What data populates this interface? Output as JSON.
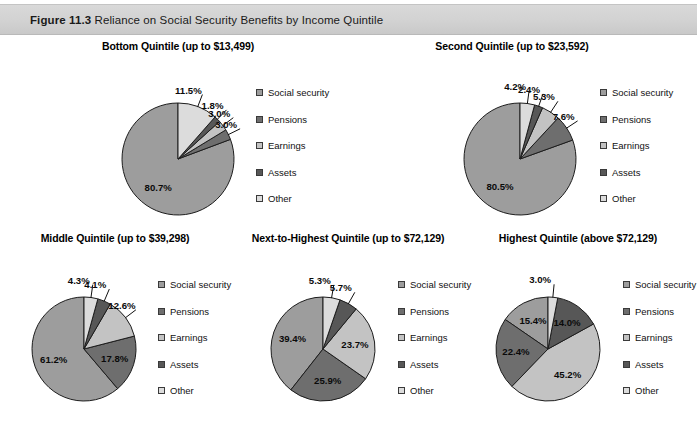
{
  "figure": {
    "number": "Figure 11.3",
    "caption": "Reliance on Social Security Benefits by Income Quintile"
  },
  "palette": {
    "social_security": "#9d9d9d",
    "pensions": "#6e6e6e",
    "earnings": "#c3c3c3",
    "assets": "#575757",
    "other": "#dcdcdc"
  },
  "legend": {
    "items": [
      {
        "label": "Social security",
        "key": "social_security"
      },
      {
        "label": "Pensions",
        "key": "pensions"
      },
      {
        "label": "Earnings",
        "key": "earnings"
      },
      {
        "label": "Assets",
        "key": "assets"
      },
      {
        "label": "Other",
        "key": "other"
      }
    ]
  },
  "chart_data": [
    {
      "type": "pie",
      "id": "bottom-quintile",
      "title": "Bottom Quintile (up to $13,499)",
      "categories": [
        "Social security",
        "Pensions",
        "Earnings",
        "Assets",
        "Other"
      ],
      "values": [
        80.7,
        3.0,
        3.0,
        1.8,
        11.5
      ],
      "labels": [
        "80.7%",
        "3.0%",
        "3.0%",
        "1.8%",
        "11.5%"
      ],
      "direction": "counterclockwise",
      "start_angle_deg": 0,
      "units": "percent"
    },
    {
      "type": "pie",
      "id": "second-quintile",
      "title": "Second Quintile (up to $23,592)",
      "categories": [
        "Social security",
        "Pensions",
        "Earnings",
        "Assets",
        "Other"
      ],
      "values": [
        80.5,
        7.6,
        5.3,
        2.4,
        4.2
      ],
      "labels": [
        "80.5%",
        "7.6%",
        "5.3%",
        "2.4%",
        "4.2%"
      ],
      "direction": "counterclockwise",
      "start_angle_deg": 0,
      "units": "percent"
    },
    {
      "type": "pie",
      "id": "middle-quintile",
      "title": "Middle Quintile (up to $39,298)",
      "categories": [
        "Social security",
        "Pensions",
        "Earnings",
        "Assets",
        "Other"
      ],
      "values": [
        61.2,
        17.8,
        12.6,
        4.1,
        4.3
      ],
      "labels": [
        "61.2%",
        "17.8%",
        "12.6%",
        "4.1%",
        "4.3%"
      ],
      "direction": "counterclockwise",
      "start_angle_deg": 0,
      "units": "percent"
    },
    {
      "type": "pie",
      "id": "next-to-highest-quintile",
      "title": "Next-to-Highest Quintile (up to $72,129)",
      "categories": [
        "Social security",
        "Pensions",
        "Earnings",
        "Assets",
        "Other"
      ],
      "values": [
        39.4,
        25.9,
        23.7,
        5.7,
        5.3
      ],
      "labels": [
        "39.4%",
        "25.9%",
        "23.7%",
        "5.7%",
        "5.3%"
      ],
      "direction": "counterclockwise",
      "start_angle_deg": 0,
      "units": "percent"
    },
    {
      "type": "pie",
      "id": "highest-quintile",
      "title": "Highest Quintile (above $72,129)",
      "categories": [
        "Social security",
        "Pensions",
        "Earnings",
        "Assets",
        "Other"
      ],
      "values": [
        15.4,
        22.4,
        45.2,
        14.0,
        3.0
      ],
      "labels": [
        "15.4%",
        "22.4%",
        "45.2%",
        "14.0%",
        "3.0%"
      ],
      "direction": "counterclockwise",
      "start_angle_deg": 0,
      "units": "percent"
    }
  ],
  "layout": {
    "panels": [
      {
        "chart": 0,
        "left": 28,
        "top": 40,
        "cx": 150,
        "cy": 105,
        "r": 56,
        "legend_left": 228,
        "legend_top": 48,
        "title_left": 28,
        "title_width": 300
      },
      {
        "chart": 1,
        "left": 372,
        "top": 40,
        "cx": 148,
        "cy": 105,
        "r": 56,
        "legend_left": 228,
        "legend_top": 48,
        "title_left": 362,
        "title_width": 300
      },
      {
        "chart": 2,
        "left": 8,
        "top": 232,
        "cx": 76,
        "cy": 103,
        "r": 52,
        "legend_left": 150,
        "legend_top": 48,
        "title_left": 0,
        "title_width": 230
      },
      {
        "chart": 3,
        "left": 238,
        "top": 232,
        "cx": 85,
        "cy": 103,
        "r": 52,
        "legend_left": 160,
        "legend_top": 48,
        "title_left": 228,
        "title_width": 240
      },
      {
        "chart": 4,
        "left": 468,
        "top": 232,
        "cx": 80,
        "cy": 103,
        "r": 52,
        "legend_left": 155,
        "legend_top": 48,
        "title_left": 458,
        "title_width": 240
      }
    ]
  }
}
